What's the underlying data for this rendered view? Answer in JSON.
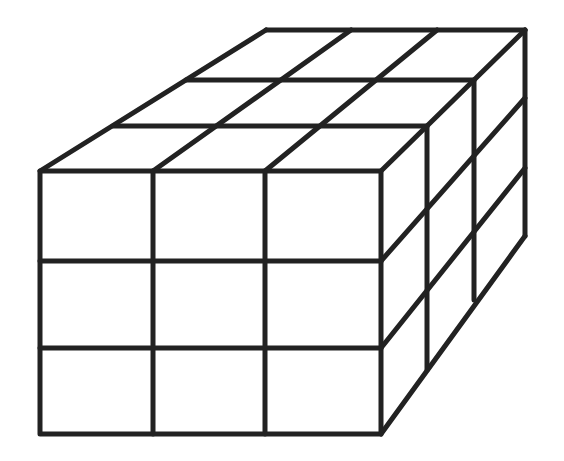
{
  "figure": {
    "grid": {
      "width": 3,
      "height": 3,
      "depth": 3
    },
    "stroke_color": "#222222",
    "background": "#ffffff"
  }
}
